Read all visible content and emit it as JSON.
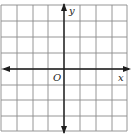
{
  "diagram": {
    "type": "coordinate-plane",
    "grid": {
      "columns": 8,
      "rows": 8,
      "cell_px": 15.8
    },
    "axes": {
      "x_label": "x",
      "y_label": "y",
      "origin_label": "O"
    },
    "colors": {
      "grid": "#8a8a8a",
      "axis": "#1e1e1e",
      "background": "#ffffff"
    }
  }
}
